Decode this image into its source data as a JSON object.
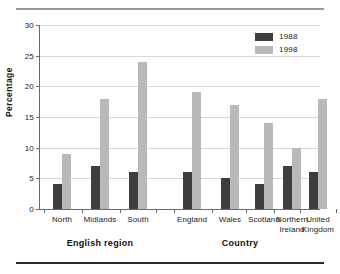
{
  "chart_data": {
    "type": "bar",
    "title": "",
    "xlabel": "",
    "ylabel": "Percentage",
    "ylim": [
      0,
      30
    ],
    "yticks": [
      0,
      5,
      10,
      15,
      20,
      25,
      30
    ],
    "ytick_labels": [
      "0",
      "5",
      "10",
      "15",
      "20",
      "25",
      "30"
    ],
    "grid": true,
    "legend_position": "top-right",
    "categories": [
      "North",
      "Midlands",
      "South",
      "England",
      "Wales",
      "Scotland",
      "Northern Ireland",
      "United Kingdom"
    ],
    "category_labels": [
      "North",
      "Midlands",
      "South",
      "England",
      "Wales",
      "Scotland",
      "Northern\nIreland",
      "United\nKingdom"
    ],
    "series": [
      {
        "name": "1988",
        "color": "#3d3d3d",
        "values": [
          4,
          7,
          6,
          6,
          5,
          4,
          7,
          6
        ]
      },
      {
        "name": "1998",
        "color": "#b9b9b9",
        "values": [
          9,
          18,
          24,
          19,
          17,
          14,
          10,
          18
        ]
      }
    ],
    "groups": [
      {
        "label": "English region",
        "categories": [
          "North",
          "Midlands",
          "South"
        ]
      },
      {
        "label": "Country",
        "categories": [
          "England",
          "Wales",
          "Scotland",
          "Northern Ireland",
          "United Kingdom"
        ]
      }
    ]
  },
  "legend": {
    "items": [
      {
        "label": "1988",
        "color": "#3d3d3d"
      },
      {
        "label": "1998",
        "color": "#b9b9b9"
      }
    ]
  },
  "axes": {
    "y_title": "Percentage"
  },
  "groups": {
    "left_title": "English region",
    "right_title": "Country"
  }
}
